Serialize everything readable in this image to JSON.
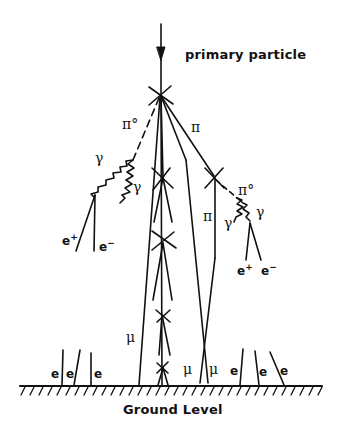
{
  "diagram": {
    "title_label": "primary particle",
    "ground_label": "Ground Level",
    "labels": {
      "pi0_left": "π°",
      "pi_upper": "π",
      "pi0_right": "π°",
      "pi_right": "π",
      "gamma_left_1": "γ",
      "gamma_left_2": "γ",
      "gamma_right_1": "γ",
      "gamma_right_2": "γ",
      "e_plus_left": "e⁺",
      "e_minus_left": "e⁻",
      "e_plus_right": "e⁺",
      "e_minus_right": "e⁻",
      "mu_left": "μ",
      "mu_center_1": "μ",
      "mu_center_2": "μ",
      "e_ground": [
        "e",
        "e",
        "e",
        "e",
        "e",
        "e"
      ]
    },
    "colors": {
      "ink": "#111111",
      "background": "#ffffff"
    }
  }
}
